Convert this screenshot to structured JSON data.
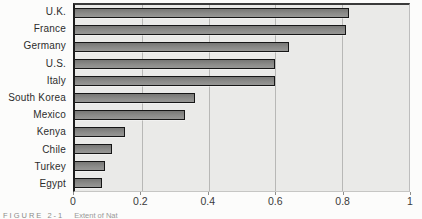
{
  "chart_data": {
    "type": "bar",
    "orientation": "horizontal",
    "title": "",
    "xlabel": "",
    "ylabel": "",
    "categories": [
      "U.K.",
      "France",
      "Germany",
      "U.S.",
      "Italy",
      "South Korea",
      "Mexico",
      "Kenya",
      "Chile",
      "Turkey",
      "Egypt"
    ],
    "values": [
      0.82,
      0.81,
      0.64,
      0.6,
      0.6,
      0.36,
      0.33,
      0.15,
      0.11,
      0.09,
      0.08
    ],
    "xlim": [
      0,
      1
    ],
    "xticks": [
      0,
      0.2,
      0.4,
      0.6,
      0.8,
      1
    ],
    "xtick_labels": [
      "0",
      "0.2",
      "0.4",
      "0.6",
      "0.8",
      "1"
    ],
    "grid": "vertical-gridlines-on",
    "legend": "none",
    "bar_color": "#8b8b89",
    "bar_border_color": "#161616",
    "plot_background": "#eaeae8",
    "gridline_color": "#b8b8b6"
  },
  "caption": {
    "label": "FIGURE 2-1",
    "text": "Extent of Nat"
  }
}
